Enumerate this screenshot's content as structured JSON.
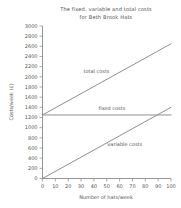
{
  "chart_data": {
    "type": "line",
    "title": "The fixed, variable and total costs for Beth Brook Hats",
    "title_line1": "The fixed, variable and total costs",
    "title_line2": "for Beth Brook Hats",
    "xlabel": "Number of hats/week",
    "ylabel": "Costs/week (£)",
    "xlim": [
      0,
      100
    ],
    "ylim": [
      0,
      3000
    ],
    "x_ticks": [
      0,
      10,
      20,
      30,
      40,
      50,
      60,
      70,
      80,
      90,
      100
    ],
    "y_ticks": [
      0,
      200,
      400,
      600,
      800,
      1000,
      1200,
      1400,
      1600,
      1800,
      2000,
      2200,
      2400,
      2600,
      2800,
      3000
    ],
    "x_tick_labels": [
      "0",
      "10",
      "20",
      "30",
      "40",
      "50",
      "60",
      "70",
      "80",
      "90",
      "100"
    ],
    "y_tick_labels": [
      "0",
      "200",
      "400",
      "600",
      "800",
      "1000",
      "1200",
      "1400",
      "1600",
      "1800",
      "2000",
      "2200",
      "2400",
      "2600",
      "2800",
      "3000"
    ],
    "grid": false,
    "legend": "inline-annotations",
    "x": [
      0,
      100
    ],
    "series": [
      {
        "name": "total costs",
        "values": [
          1250,
          2650
        ],
        "label_x": 42,
        "label_y": 2080,
        "color": "#8f8f8f"
      },
      {
        "name": "fixed costs",
        "values": [
          1250,
          1250
        ],
        "label_x": 54,
        "label_y": 1345,
        "color": "#8f8f8f"
      },
      {
        "name": "variable costs",
        "values": [
          0,
          1400
        ],
        "label_x": 64,
        "label_y": 640,
        "color": "#8f8f8f"
      }
    ]
  }
}
